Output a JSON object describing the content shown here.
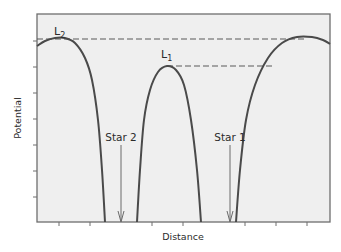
{
  "chart_data": {
    "type": "line",
    "title": "",
    "xlabel": "Distance",
    "ylabel": "Potential",
    "grid": false,
    "legend": null,
    "colors": {
      "background": "#efefef",
      "frame": "#6e6e6e",
      "curve": "#4a4a4a",
      "dashed": "#5a5a5a",
      "arrow": "#6a6a6a",
      "text": "#2b2b2b"
    },
    "frame": {
      "left": 37,
      "top": 14,
      "right": 330,
      "bottom": 222
    },
    "x_ticks_px": [
      59,
      90,
      152,
      183,
      245,
      276,
      307
    ],
    "y_ticks_px": [
      41,
      67,
      93,
      119,
      145,
      171,
      197
    ],
    "series": [
      {
        "name": "left lobe (peak L2 side)",
        "points_px": [
          [
            37,
            46
          ],
          [
            45,
            41
          ],
          [
            55,
            38
          ],
          [
            65,
            38
          ],
          [
            75,
            43
          ],
          [
            85,
            58
          ],
          [
            92,
            80
          ],
          [
            98,
            120
          ],
          [
            102,
            170
          ],
          [
            105,
            222
          ]
        ]
      },
      {
        "name": "middle lobe (peak L1)",
        "points_px": [
          [
            137,
            222
          ],
          [
            140,
            170
          ],
          [
            144,
            120
          ],
          [
            150,
            90
          ],
          [
            158,
            72
          ],
          [
            167,
            66
          ],
          [
            176,
            70
          ],
          [
            184,
            85
          ],
          [
            191,
            120
          ],
          [
            197,
            170
          ],
          [
            201,
            222
          ]
        ]
      },
      {
        "name": "right lobe",
        "points_px": [
          [
            236,
            222
          ],
          [
            240,
            170
          ],
          [
            246,
            120
          ],
          [
            255,
            85
          ],
          [
            268,
            58
          ],
          [
            282,
            43
          ],
          [
            297,
            37
          ],
          [
            312,
            37
          ],
          [
            323,
            40
          ],
          [
            330,
            44
          ]
        ]
      }
    ],
    "dashed_lines": [
      {
        "name": "L2 level",
        "x1": 37,
        "y1": 39,
        "x2": 306,
        "y2": 39
      },
      {
        "name": "L1 level",
        "x1": 167,
        "y1": 66,
        "x2": 272,
        "y2": 66
      }
    ],
    "annotations": [
      {
        "id": "l2",
        "text": "L",
        "sub": "2",
        "x": 56,
        "y": 35
      },
      {
        "id": "l1",
        "text": "L",
        "sub": "1",
        "x": 162,
        "y": 58
      },
      {
        "id": "star2",
        "text": "Star 2",
        "x": 121,
        "y": 140
      },
      {
        "id": "star1",
        "text": "Star 1",
        "x": 230,
        "y": 140
      }
    ],
    "arrows": [
      {
        "name": "star-2-arrow",
        "x": 121,
        "y1": 145,
        "y2": 222
      },
      {
        "name": "star-1-arrow",
        "x": 230,
        "y1": 145,
        "y2": 222
      }
    ]
  },
  "labels": {
    "xlabel": "Distance",
    "ylabel": "Potential",
    "l2_main": "L",
    "l2_sub": "2",
    "l1_main": "L",
    "l1_sub": "1",
    "star2": "Star 2",
    "star1": "Star 1"
  }
}
